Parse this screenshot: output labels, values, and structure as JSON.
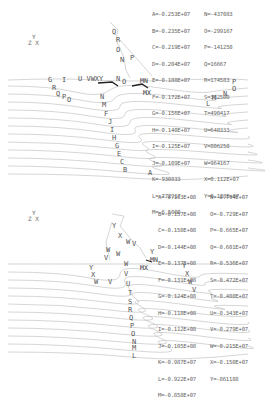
{
  "top_plot": {
    "axis_triad": {
      "y": "Y",
      "zx": "Z X"
    },
    "legend": [
      [
        "A=-0.253E+07",
        "N=-437083"
      ],
      [
        "B=-0.235E+07",
        "O=-299167"
      ],
      [
        "C=-0.219E+07",
        "P=-141250"
      ],
      [
        "D=-0.204E+07",
        "Q=16667"
      ],
      [
        "E=-0.188E+07",
        "R=174583"
      ],
      [
        "F=-0.172E+07",
        "S=332500"
      ],
      [
        "G=-0.156E+07",
        "T=490417"
      ],
      [
        "H=-0.140E+07",
        "U=648333"
      ],
      [
        "I=-0.125E+07",
        "V=806250"
      ],
      [
        "J=-0.109E+07",
        "W=964167"
      ],
      [
        "K=-930833",
        "X=0.112E+07"
      ],
      [
        "L=-772917",
        "Y=0.128E+07"
      ],
      [
        "M=-6.5000",
        ""
      ]
    ],
    "markers": {
      "mn": "MN",
      "mx": "MX"
    }
  },
  "bottom_plot": {
    "axis_triad": {
      "y": "Y",
      "zx": "Z X"
    },
    "legend": [
      [
        "A=-0.163E+08",
        "N=-0.794E+07"
      ],
      [
        "B=-0.157E+08",
        "O=-0.729E+07"
      ],
      [
        "C=-0.150E+08",
        "P=-0.665E+07"
      ],
      [
        "D=-0.144E+08",
        "Q=-0.601E+07"
      ],
      [
        "E=-0.137E+08",
        "R=-0.536E+07"
      ],
      [
        "F=-0.131E+08",
        "S=-0.472E+07"
      ],
      [
        "G=-0.124E+08",
        "T=-0.408E+07"
      ],
      [
        "H=-0.118E+08",
        "U=-0.343E+07"
      ],
      [
        "I=-0.112E+08",
        "V=-0.279E+07"
      ],
      [
        "J=-0.105E+08",
        "W=-0.215E+07"
      ],
      [
        "K=-0.987E+07",
        "X=-0.150E+07"
      ],
      [
        "L=-0.922E+07",
        "Y=-861188"
      ],
      [
        "M=-0.858E+07",
        ""
      ]
    ],
    "markers": {
      "mn": "MN",
      "mx": "MX"
    }
  }
}
